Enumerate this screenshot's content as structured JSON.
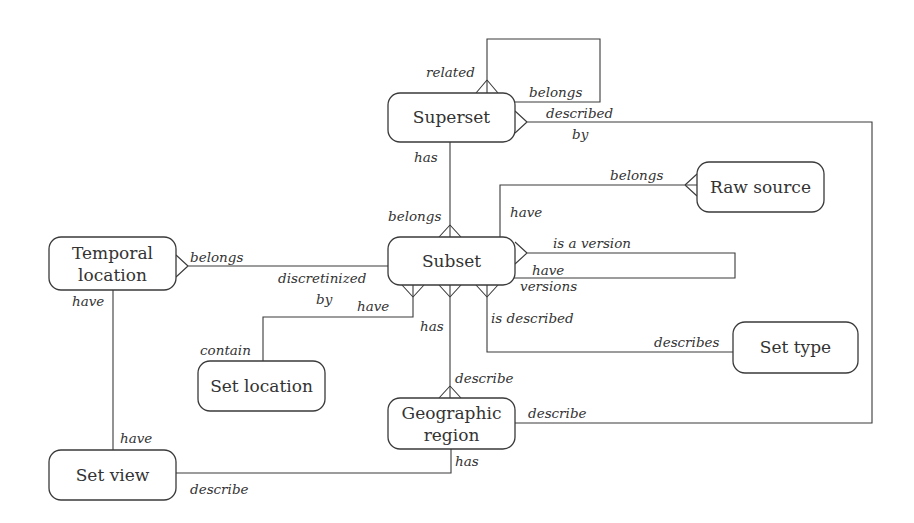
{
  "diagram": {
    "type": "entity-relationship",
    "notation": "crow's foot",
    "colors": {
      "stroke": "#3a3a3a",
      "text": "#333333",
      "background": "#ffffff"
    },
    "entities": {
      "superset": {
        "lines": [
          "Superset"
        ]
      },
      "subset": {
        "lines": [
          "Subset"
        ]
      },
      "raw_source": {
        "lines": [
          "Raw source"
        ]
      },
      "temporal_location": {
        "lines": [
          "Temporal",
          "location"
        ]
      },
      "set_location": {
        "lines": [
          "Set location"
        ]
      },
      "set_type": {
        "lines": [
          "Set type"
        ]
      },
      "geographic_region": {
        "lines": [
          "Geographic",
          "region"
        ]
      },
      "set_view": {
        "lines": [
          "Set view"
        ]
      }
    },
    "relationships": {
      "superset_self": {
        "labels": [
          "related",
          "belongs"
        ],
        "from": "Superset",
        "to": "Superset"
      },
      "superset_region": {
        "labels": [
          "described",
          "by",
          "describe"
        ],
        "from": "Superset",
        "to": "Geographic region"
      },
      "superset_subset": {
        "labels": [
          "has",
          "belongs"
        ],
        "from": "Superset",
        "to": "Subset"
      },
      "subset_raw": {
        "labels": [
          "have",
          "belongs"
        ],
        "from": "Subset",
        "to": "Raw source"
      },
      "subset_self": {
        "labels": [
          "is a version",
          "have",
          "versions"
        ],
        "from": "Subset",
        "to": "Subset"
      },
      "temporal_subset": {
        "labels": [
          "belongs",
          "discretinized",
          "by"
        ],
        "from": "Temporal location",
        "to": "Subset"
      },
      "subset_setlocation": {
        "labels": [
          "have",
          "contain"
        ],
        "from": "Subset",
        "to": "Set location"
      },
      "subset_region": {
        "labels": [
          "has",
          "describe"
        ],
        "from": "Subset",
        "to": "Geographic region"
      },
      "subset_settype": {
        "labels": [
          "is described",
          "describes"
        ],
        "from": "Subset",
        "to": "Set type"
      },
      "temporal_setview": {
        "labels": [
          "have",
          "have"
        ],
        "from": "Temporal location",
        "to": "Set view"
      },
      "setview_region": {
        "labels": [
          "describe",
          "has"
        ],
        "from": "Set view",
        "to": "Geographic region"
      }
    }
  }
}
